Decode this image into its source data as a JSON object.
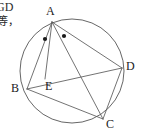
{
  "figure": {
    "kind": "circle-geometry-diagram",
    "background_color": "#ffffff",
    "stroke_color": "#555555",
    "label_color": "#1a1a1a",
    "width": 142,
    "height": 133
  },
  "margin_text": {
    "line1": "GD",
    "line2": "等，"
  },
  "circle": {
    "name": "circumcircle",
    "cx": 72,
    "cy": 71,
    "r": 52
  },
  "points": [
    {
      "id": "A",
      "label": "A",
      "x": 52,
      "y": 22,
      "label_x": 46,
      "label_y": 5,
      "on_circle": true
    },
    {
      "id": "B",
      "label": "B",
      "x": 27,
      "y": 89,
      "label_x": 11,
      "label_y": 82,
      "on_circle": true
    },
    {
      "id": "C",
      "label": "C",
      "x": 103,
      "y": 119,
      "label_x": 106,
      "label_y": 118,
      "on_circle": true
    },
    {
      "id": "D",
      "label": "D",
      "x": 122,
      "y": 68,
      "label_x": 126,
      "label_y": 60,
      "on_circle": true
    },
    {
      "id": "E",
      "label": "E",
      "x": 45,
      "y": 79,
      "label_x": 45,
      "label_y": 80,
      "on_circle": false
    }
  ],
  "segments": [
    {
      "id": "AB",
      "from": "A",
      "to": "B"
    },
    {
      "id": "AE",
      "from": "A",
      "to": "E"
    },
    {
      "id": "AC",
      "from": "A",
      "to": "C"
    },
    {
      "id": "AD",
      "from": "A",
      "to": "D"
    },
    {
      "id": "BD",
      "from": "B",
      "to": "D"
    },
    {
      "id": "BC",
      "from": "B",
      "to": "C"
    },
    {
      "id": "CD",
      "from": "C",
      "to": "D"
    }
  ],
  "angle_marks": [
    {
      "id": "mark-1",
      "vertex": "A",
      "between": "AB-AE",
      "style": "dot",
      "x": 45,
      "y": 39
    },
    {
      "id": "mark-2",
      "vertex": "A",
      "between": "AE-AC",
      "style": "dot",
      "x": 64,
      "y": 36
    }
  ]
}
